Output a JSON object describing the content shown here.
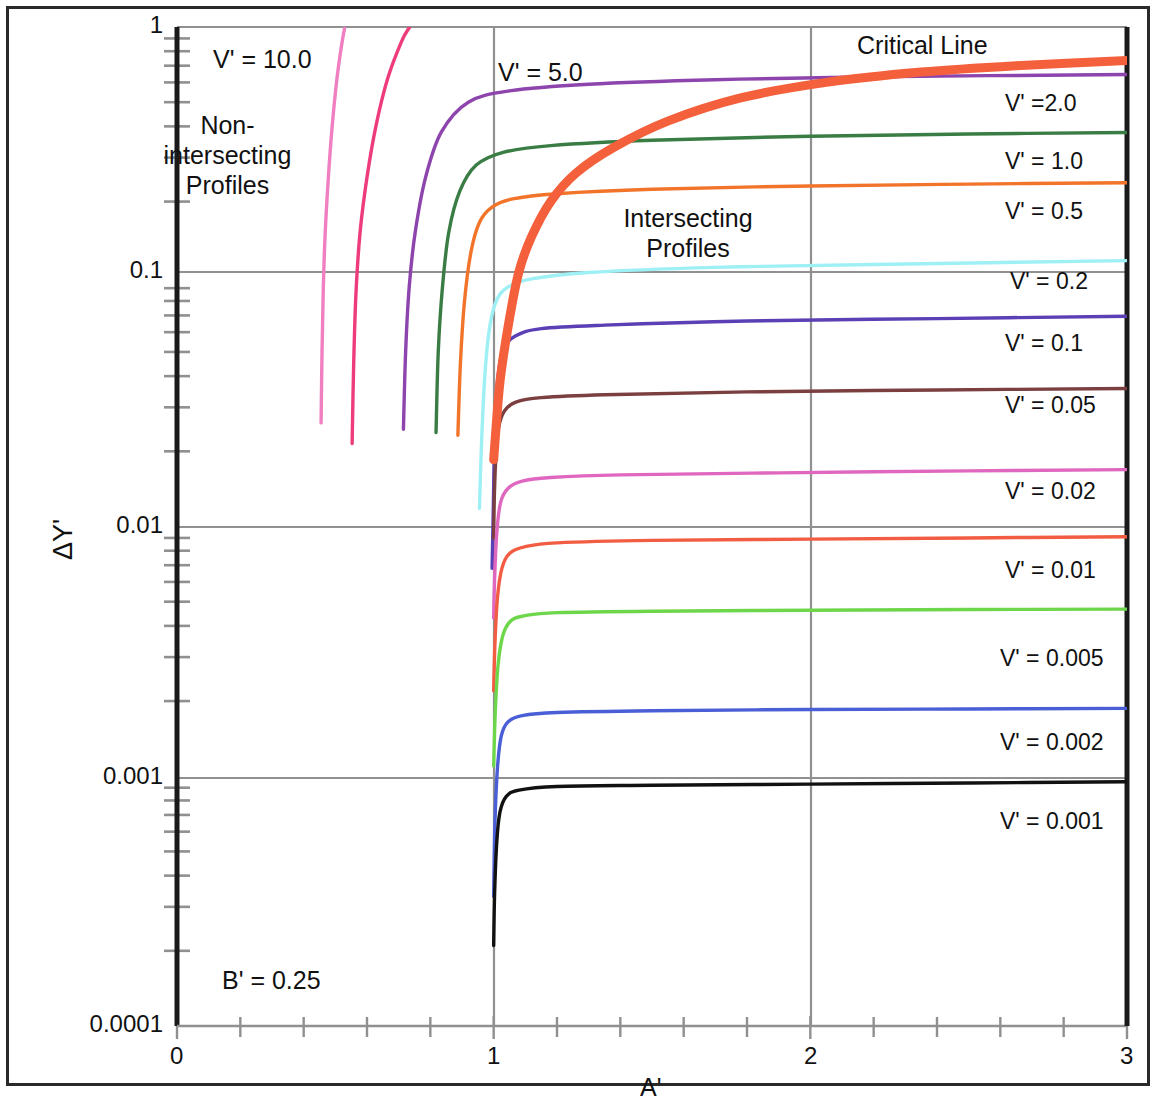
{
  "figure": {
    "y_axis_title": "ΔY'",
    "x_axis_title": "A'",
    "annotations": [
      {
        "name": "non-intersecting",
        "line1": "Non-",
        "line2": "intersecting",
        "line3": "Profiles",
        "x": 223,
        "y": 115
      },
      {
        "name": "intersecting",
        "line1": "Intersecting",
        "line2": "Profiles",
        "x": 608,
        "y": 205
      },
      {
        "name": "critical-line",
        "text": "Critical Line",
        "x": 857,
        "y": 32
      },
      {
        "name": "v-10",
        "text": "V' = 10.0",
        "x": 213,
        "y": 46
      },
      {
        "name": "v-5",
        "text": "V' = 5.0",
        "x": 498,
        "y": 59
      },
      {
        "name": "b-prime",
        "text": "B' = 0.25",
        "x": 222,
        "y": 969
      }
    ],
    "y_ticks": [
      {
        "label": "1",
        "value": 1,
        "py": 27
      },
      {
        "label": "0.1",
        "value": 0.1,
        "py": 272
      },
      {
        "label": "0.01",
        "value": 0.01,
        "py": 527
      },
      {
        "label": "0.001",
        "value": 0.001,
        "py": 778
      },
      {
        "label": "0.0001",
        "value": 0.0001,
        "py": 1026
      }
    ],
    "x_ticks": [
      {
        "label": "0",
        "value": 0,
        "px": 177
      },
      {
        "label": "1",
        "value": 1,
        "px": 494
      },
      {
        "label": "2",
        "value": 2,
        "px": 811
      },
      {
        "label": "3",
        "value": 3,
        "px": 1127
      }
    ],
    "colors": {
      "grid": "#909090",
      "axis": "#1a1a1a",
      "frame": "#2a2a2a",
      "critical_line": "#f4603c"
    }
  },
  "chart_data": {
    "type": "line",
    "title": "",
    "xlabel": "A'",
    "ylabel": "ΔY'",
    "xlim": [
      0,
      3
    ],
    "ylim": [
      0.0001,
      1
    ],
    "yscale": "log",
    "xscale": "linear",
    "grid": true,
    "legend": "inline-right-labels",
    "parameter": "B' = 0.25",
    "regions": [
      "Non-intersecting Profiles",
      "Intersecting Profiles"
    ],
    "series": [
      {
        "name": "V' = 10.0",
        "label": "V' = 10.0",
        "color": "#ef7fc0",
        "label_x": 213,
        "label_y": 46,
        "points": [
          [
            0.455,
            0.026
          ],
          [
            0.458,
            0.05
          ],
          [
            0.462,
            0.09
          ],
          [
            0.468,
            0.15
          ],
          [
            0.478,
            0.25
          ],
          [
            0.49,
            0.4
          ],
          [
            0.505,
            0.62
          ],
          [
            0.52,
            0.85
          ],
          [
            0.53,
            1.0
          ]
        ]
      },
      {
        "name": "V' = 5.0",
        "label": "V' = 5.0",
        "color": "#ee3b7b",
        "label_x": 498,
        "label_y": 59,
        "points": [
          [
            0.553,
            0.0215
          ],
          [
            0.558,
            0.045
          ],
          [
            0.565,
            0.085
          ],
          [
            0.578,
            0.15
          ],
          [
            0.6,
            0.25
          ],
          [
            0.628,
            0.4
          ],
          [
            0.665,
            0.62
          ],
          [
            0.71,
            0.88
          ],
          [
            0.735,
            1.0
          ]
        ]
      },
      {
        "name": "V' = 2.0",
        "label": "V' =2.0",
        "color": "#8d44ad",
        "label_x": 1005,
        "label_y": 90,
        "points": [
          [
            0.715,
            0.0245
          ],
          [
            0.722,
            0.05
          ],
          [
            0.733,
            0.09
          ],
          [
            0.752,
            0.15
          ],
          [
            0.785,
            0.25
          ],
          [
            0.835,
            0.38
          ],
          [
            0.92,
            0.5
          ],
          [
            1.05,
            0.555
          ],
          [
            1.3,
            0.59
          ],
          [
            1.7,
            0.615
          ],
          [
            2.2,
            0.632
          ],
          [
            3.0,
            0.645
          ]
        ]
      },
      {
        "name": "V' = 1.0",
        "label": "V' = 1.0",
        "color": "#3a7d44",
        "color2": "#3a7d44",
        "label_x": 1005,
        "label_y": 148,
        "points": [
          [
            0.818,
            0.0238
          ],
          [
            0.825,
            0.05
          ],
          [
            0.838,
            0.09
          ],
          [
            0.858,
            0.15
          ],
          [
            0.893,
            0.22
          ],
          [
            0.945,
            0.28
          ],
          [
            1.03,
            0.315
          ],
          [
            1.18,
            0.335
          ],
          [
            1.5,
            0.352
          ],
          [
            2.0,
            0.365
          ],
          [
            2.5,
            0.373
          ],
          [
            3.0,
            0.378
          ]
        ]
      },
      {
        "name": "V' = 0.5",
        "label": "V' = 0.5",
        "color": "#f2742b",
        "label_x": 1005,
        "label_y": 198,
        "points": [
          [
            0.887,
            0.0232
          ],
          [
            0.895,
            0.045
          ],
          [
            0.908,
            0.08
          ],
          [
            0.928,
            0.125
          ],
          [
            0.955,
            0.165
          ],
          [
            0.995,
            0.19
          ],
          [
            1.06,
            0.205
          ],
          [
            1.2,
            0.215
          ],
          [
            1.5,
            0.224
          ],
          [
            2.0,
            0.231
          ],
          [
            2.5,
            0.235
          ],
          [
            3.0,
            0.238
          ]
        ]
      },
      {
        "name": "V' = 0.2",
        "label": "V' = 0.2",
        "color": "#9ef0f5",
        "label_x": 1010,
        "label_y": 268,
        "points": [
          [
            0.955,
            0.0118
          ],
          [
            0.962,
            0.022
          ],
          [
            0.972,
            0.04
          ],
          [
            0.985,
            0.06
          ],
          [
            1.005,
            0.078
          ],
          [
            1.04,
            0.09
          ],
          [
            1.12,
            0.098
          ],
          [
            1.3,
            0.104
          ],
          [
            1.7,
            0.109
          ],
          [
            2.2,
            0.112
          ],
          [
            3.0,
            0.116
          ]
        ]
      },
      {
        "name": "V' = 0.1",
        "label": "V' = 0.1",
        "color": "#5b3fb5",
        "label_x": 1005,
        "label_y": 330,
        "points": [
          [
            0.995,
            0.0068
          ],
          [
            0.999,
            0.012
          ],
          [
            1.003,
            0.022
          ],
          [
            1.012,
            0.038
          ],
          [
            1.03,
            0.051
          ],
          [
            1.07,
            0.058
          ],
          [
            1.15,
            0.062
          ],
          [
            1.35,
            0.064
          ],
          [
            1.8,
            0.0665
          ],
          [
            2.4,
            0.068
          ],
          [
            3.0,
            0.0695
          ]
        ]
      },
      {
        "name": "V' = 0.05",
        "label": "V' = 0.05",
        "color": "#7b3f3f",
        "label_x": 1005,
        "label_y": 392,
        "points": [
          [
            1.0,
            0.009
          ],
          [
            1.002,
            0.013
          ],
          [
            1.007,
            0.019
          ],
          [
            1.016,
            0.025
          ],
          [
            1.034,
            0.029
          ],
          [
            1.07,
            0.0315
          ],
          [
            1.15,
            0.0328
          ],
          [
            1.35,
            0.0337
          ],
          [
            1.8,
            0.0346
          ],
          [
            2.4,
            0.0352
          ],
          [
            3.0,
            0.0357
          ]
        ]
      },
      {
        "name": "V' = 0.02",
        "label": "V' = 0.02",
        "color": "#e067bf",
        "label_x": 1005,
        "label_y": 478,
        "points": [
          [
            1.0,
            0.0043
          ],
          [
            1.003,
            0.0062
          ],
          [
            1.01,
            0.0095
          ],
          [
            1.022,
            0.0125
          ],
          [
            1.045,
            0.0142
          ],
          [
            1.09,
            0.0152
          ],
          [
            1.18,
            0.0157
          ],
          [
            1.4,
            0.0161
          ],
          [
            1.9,
            0.0164
          ],
          [
            2.5,
            0.0167
          ],
          [
            3.0,
            0.0169
          ]
        ]
      },
      {
        "name": "V' = 0.01",
        "label": "V' = 0.01",
        "color": "#f25c42",
        "label_x": 1005,
        "label_y": 557,
        "points": [
          [
            1.0,
            0.0022
          ],
          [
            1.004,
            0.0034
          ],
          [
            1.012,
            0.0052
          ],
          [
            1.026,
            0.0068
          ],
          [
            1.05,
            0.0078
          ],
          [
            1.1,
            0.0083
          ],
          [
            1.2,
            0.0086
          ],
          [
            1.5,
            0.0088
          ],
          [
            2.0,
            0.0089
          ],
          [
            2.5,
            0.009
          ],
          [
            3.0,
            0.0091
          ]
        ]
      },
      {
        "name": "V' = 0.005",
        "label": "V' = 0.005",
        "color": "#6ed64a",
        "label_x": 1000,
        "label_y": 645,
        "points": [
          [
            1.0,
            0.0011
          ],
          [
            1.005,
            0.0018
          ],
          [
            1.014,
            0.0028
          ],
          [
            1.03,
            0.0037
          ],
          [
            1.055,
            0.0042
          ],
          [
            1.1,
            0.0044
          ],
          [
            1.2,
            0.00452
          ],
          [
            1.5,
            0.00458
          ],
          [
            2.0,
            0.00462
          ],
          [
            2.5,
            0.00465
          ],
          [
            3.0,
            0.00467
          ]
        ]
      },
      {
        "name": "V' = 0.002",
        "label": "V' = 0.002",
        "color": "#4a5ed6",
        "label_x": 1000,
        "label_y": 729,
        "points": [
          [
            1.0,
            0.00033
          ],
          [
            1.004,
            0.00065
          ],
          [
            1.012,
            0.00108
          ],
          [
            1.024,
            0.00145
          ],
          [
            1.045,
            0.00165
          ],
          [
            1.09,
            0.00175
          ],
          [
            1.2,
            0.0018
          ],
          [
            1.5,
            0.00183
          ],
          [
            2.0,
            0.00185
          ],
          [
            2.5,
            0.00186
          ],
          [
            3.0,
            0.00187
          ]
        ]
      },
      {
        "name": "V' = 0.001",
        "label": "V' = 0.001",
        "color": "#111111",
        "label_x": 1000,
        "label_y": 808,
        "points": [
          [
            1.0,
            0.00021
          ],
          [
            1.003,
            0.00034
          ],
          [
            1.01,
            0.00055
          ],
          [
            1.02,
            0.00072
          ],
          [
            1.04,
            0.00083
          ],
          [
            1.08,
            0.00088
          ],
          [
            1.2,
            0.00091
          ],
          [
            1.5,
            0.00092
          ],
          [
            2.0,
            0.00093
          ],
          [
            2.5,
            0.00094
          ],
          [
            3.0,
            0.00095
          ]
        ]
      },
      {
        "name": "Critical Line",
        "label": "Critical Line",
        "color": "#f4603c",
        "width": 9,
        "label_x": 857,
        "label_y": 32,
        "points": [
          [
            1.0,
            0.0185
          ],
          [
            1.02,
            0.038
          ],
          [
            1.05,
            0.068
          ],
          [
            1.08,
            0.105
          ],
          [
            1.12,
            0.145
          ],
          [
            1.18,
            0.2
          ],
          [
            1.26,
            0.26
          ],
          [
            1.38,
            0.33
          ],
          [
            1.55,
            0.42
          ],
          [
            1.78,
            0.52
          ],
          [
            2.05,
            0.6
          ],
          [
            2.35,
            0.66
          ],
          [
            2.65,
            0.7
          ],
          [
            3.0,
            0.735
          ]
        ]
      }
    ]
  }
}
